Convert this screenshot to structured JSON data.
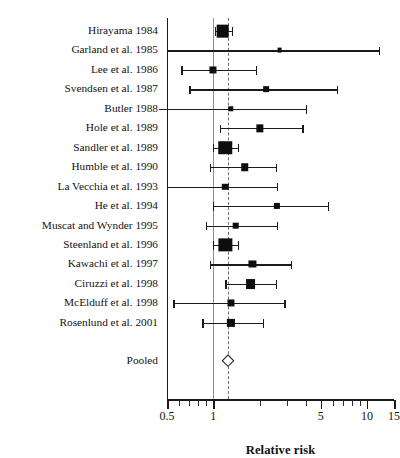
{
  "chart_data": {
    "type": "scatter",
    "plot_kind": "forest-plot",
    "title": "",
    "xlabel": "Relative risk",
    "ylabel": "",
    "xscale": "log",
    "xlim": [
      0.5,
      15
    ],
    "grid": false,
    "legend": null,
    "null_line": 1,
    "pooled_line": 1.25,
    "axis_ticks_major": [
      {
        "value": 0.5,
        "label": "0.5"
      },
      {
        "value": 1,
        "label": "1"
      },
      {
        "value": 5,
        "label": "5"
      },
      {
        "value": 10,
        "label": "10"
      },
      {
        "value": 15,
        "label": "15"
      }
    ],
    "axis_ticks_minor": [
      0.6,
      0.7,
      0.8,
      0.9,
      2,
      3,
      4,
      6,
      7,
      8,
      9
    ],
    "categories": [
      "Hirayama 1984",
      "Garland et al. 1985",
      "Lee et al. 1986",
      "Svendsen et al. 1987",
      "Butler 1988",
      "Hole et al. 1989",
      "Sandler et al. 1989",
      "Humble et al. 1990",
      "La Vecchia et al. 1993",
      "He et al. 1994",
      "Muscat and Wynder 1995",
      "Steenland et al. 1996",
      "Kawachi et al. 1997",
      "Ciruzzi et al. 1998",
      "McElduff et al. 1998",
      "Rosenlund et al. 2001",
      "Pooled"
    ],
    "studies": [
      {
        "label": "Hirayama 1984",
        "estimate": 1.15,
        "ci_low": 1.02,
        "ci_high": 1.32,
        "weight": 9.0,
        "marker": "square",
        "low_offscale": false,
        "high_offscale": false
      },
      {
        "label": "Garland et al. 1985",
        "estimate": 2.7,
        "ci_low": 0.5,
        "ci_high": 12.0,
        "weight": 2.0,
        "marker": "square",
        "low_offscale": false,
        "high_offscale": false
      },
      {
        "label": "Lee et al. 1986",
        "estimate": 1.0,
        "ci_low": 0.62,
        "ci_high": 1.9,
        "weight": 4.0,
        "marker": "square",
        "low_offscale": false,
        "high_offscale": false
      },
      {
        "label": "Svendsen et al. 1987",
        "estimate": 2.2,
        "ci_low": 0.7,
        "ci_high": 6.4,
        "weight": 2.8,
        "marker": "square",
        "low_offscale": false,
        "high_offscale": false
      },
      {
        "label": "Butler 1988",
        "estimate": 1.3,
        "ci_low": 0.3,
        "ci_high": 4.0,
        "weight": 2.6,
        "marker": "square",
        "low_offscale": true,
        "high_offscale": false
      },
      {
        "label": "Hole et al. 1989",
        "estimate": 2.0,
        "ci_low": 1.1,
        "ci_high": 3.8,
        "weight": 4.2,
        "marker": "square",
        "low_offscale": false,
        "high_offscale": false
      },
      {
        "label": "Sandler et al. 1989",
        "estimate": 1.2,
        "ci_low": 1.0,
        "ci_high": 1.45,
        "weight": 10.0,
        "marker": "square",
        "low_offscale": false,
        "high_offscale": false
      },
      {
        "label": "Humble et al. 1990",
        "estimate": 1.6,
        "ci_low": 0.95,
        "ci_high": 2.55,
        "weight": 4.4,
        "marker": "square",
        "low_offscale": false,
        "high_offscale": false
      },
      {
        "label": "La Vecchia et al. 1993",
        "estimate": 1.2,
        "ci_low": 0.5,
        "ci_high": 2.6,
        "weight": 3.4,
        "marker": "square",
        "low_offscale": false,
        "high_offscale": false
      },
      {
        "label": "He et al. 1994",
        "estimate": 2.6,
        "ci_low": 1.0,
        "ci_high": 5.6,
        "weight": 3.2,
        "marker": "square",
        "low_offscale": false,
        "high_offscale": false
      },
      {
        "label": "Muscat and Wynder 1995",
        "estimate": 1.4,
        "ci_low": 0.9,
        "ci_high": 2.6,
        "weight": 3.6,
        "marker": "square",
        "low_offscale": false,
        "high_offscale": false
      },
      {
        "label": "Steenland et al. 1996",
        "estimate": 1.2,
        "ci_low": 1.0,
        "ci_high": 1.45,
        "weight": 9.5,
        "marker": "square",
        "low_offscale": false,
        "high_offscale": false
      },
      {
        "label": "Kawachi et al. 1997",
        "estimate": 1.8,
        "ci_low": 0.95,
        "ci_high": 3.2,
        "weight": 4.0,
        "marker": "square",
        "low_offscale": false,
        "high_offscale": false
      },
      {
        "label": "Ciruzzi et al. 1998",
        "estimate": 1.75,
        "ci_low": 1.2,
        "ci_high": 2.55,
        "weight": 6.5,
        "marker": "square",
        "low_offscale": false,
        "high_offscale": false
      },
      {
        "label": "McElduff et al. 1998",
        "estimate": 1.3,
        "ci_low": 0.55,
        "ci_high": 2.9,
        "weight": 4.0,
        "marker": "square",
        "low_offscale": false,
        "high_offscale": false
      },
      {
        "label": "Rosenlund et al. 2001",
        "estimate": 1.3,
        "ci_low": 0.85,
        "ci_high": 2.1,
        "weight": 5.0,
        "marker": "square",
        "low_offscale": false,
        "high_offscale": false
      },
      {
        "label": "Pooled",
        "estimate": 1.25,
        "ci_low": 1.17,
        "ci_high": 1.33,
        "weight": 0,
        "marker": "diamond",
        "low_offscale": false,
        "high_offscale": false
      }
    ]
  }
}
